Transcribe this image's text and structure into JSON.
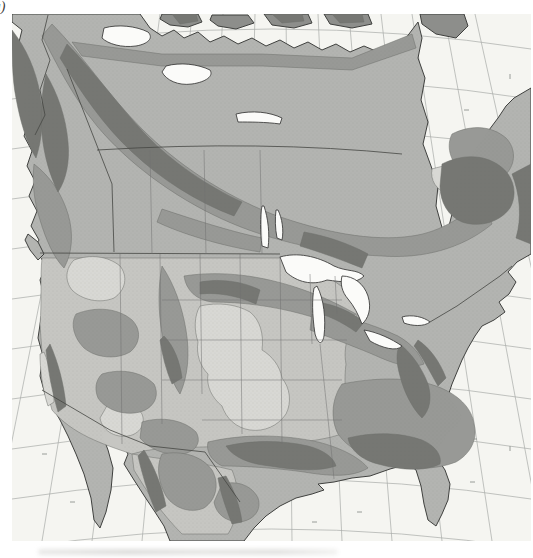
{
  "figure": {
    "label": "(a)"
  },
  "colors": {
    "page_background": "#ffffff",
    "ocean": "#f5f5f1",
    "graticule": "#a7aba7",
    "tick": "#8f938f",
    "land_base": "#b3b4b1",
    "shade_light": "#c6c6c2",
    "shade_pale": "#d8d8d4",
    "shade_medium": "#989996",
    "shade_dark": "#767773",
    "island_fill": "#8d8e8b",
    "lake": "#fbfbf9",
    "coastline": "#3f403e",
    "contour_line": "#6d6e6b",
    "border": "#454643",
    "state_line": "#707170",
    "stipple": "#63655f",
    "caption_smudge": "#c6c6c3"
  }
}
